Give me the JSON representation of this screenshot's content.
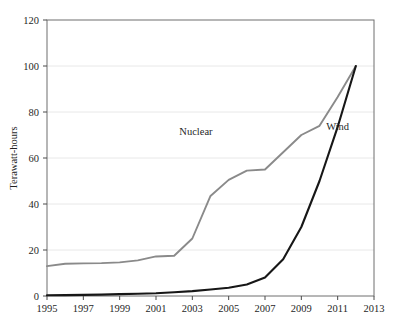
{
  "chart_data": {
    "type": "line",
    "title": "",
    "subtitle": "",
    "xlabel": "",
    "ylabel": "Terawatt-hours",
    "xlim": [
      1995,
      2013
    ],
    "ylim": [
      0,
      120
    ],
    "grid": true,
    "grid_axis": "y",
    "legend_position": "inline-annotation",
    "x_ticks": [
      "1995",
      "1997",
      "1999",
      "2001",
      "2003",
      "2005",
      "2007",
      "2009",
      "2011",
      "2013"
    ],
    "x_tick_values": [
      1995,
      1997,
      1999,
      2001,
      2003,
      2005,
      2007,
      2009,
      2011,
      2013
    ],
    "y_ticks": [
      "0",
      "20",
      "40",
      "60",
      "80",
      "100",
      "120"
    ],
    "y_tick_values": [
      0,
      20,
      40,
      60,
      80,
      100,
      120
    ],
    "x": [
      1995,
      1996,
      1997,
      1998,
      1999,
      2000,
      2001,
      2002,
      2003,
      2004,
      2005,
      2006,
      2007,
      2008,
      2009,
      2010,
      2011,
      2012
    ],
    "series": [
      {
        "name": "Nuclear",
        "color": "#8a8a8a",
        "label_x": 2003.2,
        "label_y": 70,
        "values": [
          13.0,
          14.0,
          14.2,
          14.3,
          14.6,
          15.5,
          17.2,
          17.5,
          25.0,
          43.5,
          50.5,
          54.5,
          55.0,
          62.5,
          70.0,
          74.0,
          86.5,
          100.0
        ]
      },
      {
        "name": "Wind",
        "color": "#171717",
        "label_x": 2011.0,
        "label_y": 72,
        "values": [
          0.3,
          0.4,
          0.5,
          0.6,
          0.8,
          1.0,
          1.2,
          1.6,
          2.1,
          2.8,
          3.6,
          5.0,
          8.0,
          16.0,
          30.0,
          50.0,
          73.5,
          100.0
        ]
      }
    ]
  }
}
